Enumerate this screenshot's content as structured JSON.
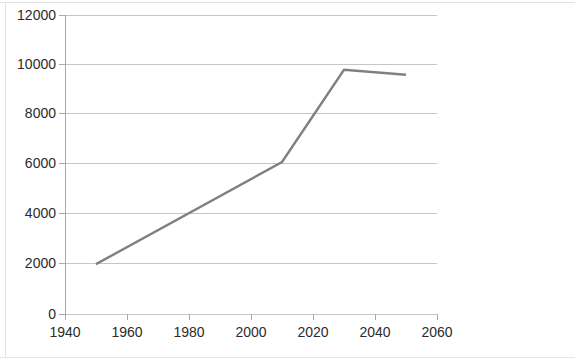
{
  "chart_data": {
    "type": "line",
    "title": "",
    "subtitle": "",
    "xlabel": "",
    "ylabel": "",
    "xlim": [
      1940,
      2060
    ],
    "ylim": [
      0,
      12000
    ],
    "grid": true,
    "legend": false,
    "legend_position": "none",
    "x_ticks": [
      "1940",
      "1960",
      "1980",
      "2000",
      "2020",
      "2040",
      "2060"
    ],
    "x_tick_values": [
      1940,
      1960,
      1980,
      2000,
      2020,
      2040,
      2060
    ],
    "y_ticks": [
      "0",
      "2000",
      "4000",
      "6000",
      "8000",
      "10000",
      "12000"
    ],
    "y_tick_values": [
      0,
      2000,
      4000,
      6000,
      8000,
      10000,
      12000
    ],
    "series": [
      {
        "name": "series-1",
        "color": "#808080",
        "x": [
          1950,
          2010,
          2030,
          2050
        ],
        "values": [
          2000,
          6100,
          9800,
          9600
        ]
      }
    ]
  },
  "style": {
    "line_color": "#808080",
    "grid_color": "#c6c6c6",
    "axis_color": "#a9a9a9",
    "text_color": "#2b2b2b",
    "background": "#ffffff"
  }
}
